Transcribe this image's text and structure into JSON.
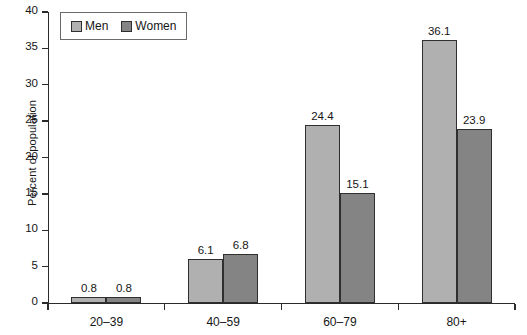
{
  "chart_data": {
    "type": "bar",
    "title": "",
    "subtitle": "",
    "xlabel": "",
    "ylabel": "Percent of population",
    "categories": [
      "20–39",
      "40–59",
      "60–79",
      "80+"
    ],
    "series": [
      {
        "name": "Men",
        "values": [
          0.8,
          6.1,
          24.4,
          36.1
        ],
        "color": "#b0b0b0"
      },
      {
        "name": "Women",
        "values": [
          0.8,
          6.8,
          15.1,
          23.9
        ],
        "color": "#848484"
      }
    ],
    "data_labels": [
      "0.8",
      "0.8",
      "6.1",
      "6.8",
      "24.4",
      "15.1",
      "36.1",
      "23.9"
    ],
    "ylim": [
      0,
      40
    ],
    "yticks": [
      0,
      5,
      10,
      15,
      20,
      25,
      30,
      35,
      40
    ],
    "ytick_labels": [
      "0",
      "5",
      "10",
      "15",
      "20",
      "25",
      "30",
      "35",
      "40"
    ],
    "grid": false,
    "legend_position": "top-left",
    "legend_entries": [
      "Men",
      "Women"
    ],
    "axis_color": "#2b2b2b",
    "bar_edge_color": "#2f2f2f",
    "background": "#ffffff"
  }
}
